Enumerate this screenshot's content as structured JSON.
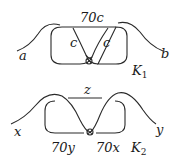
{
  "diagram": {
    "k1": {
      "name": "K",
      "subscript": "1",
      "top_label": "70c",
      "left_inner_label": "c",
      "right_inner_label": "c",
      "left_end_label": "a",
      "right_end_label": "b"
    },
    "k2": {
      "name": "K",
      "subscript": "2",
      "top_label": "z",
      "bottom_left_label": "70y",
      "bottom_right_label": "70x",
      "left_end_label": "x",
      "right_end_label": "y"
    },
    "colors": {
      "stroke": "#2a2a2a",
      "background": "#ffffff"
    }
  }
}
